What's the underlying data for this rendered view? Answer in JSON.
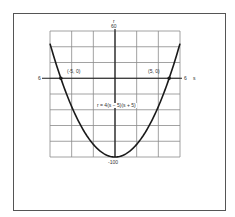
{
  "chart_data": {
    "type": "line",
    "title": "",
    "equation": "r = 4(s − 5)(s + 5)",
    "xlabel": "s",
    "ylabel": "r",
    "xlim": [
      -6,
      6
    ],
    "ylim": [
      -100,
      60
    ],
    "grid": true,
    "x_grid_step": 2,
    "y_grid_step": 20,
    "tick_labels": {
      "y_top": "60",
      "y_bottom": "-100",
      "x_left": "6",
      "x_right": "6"
    },
    "series": [
      {
        "name": "r = 4(s − 5)(s + 5)",
        "x": [
          -6,
          -5,
          -4,
          -3,
          -2,
          -1,
          0,
          1,
          2,
          3,
          4,
          5,
          6
        ],
        "y": [
          44,
          0,
          -36,
          -64,
          -84,
          -96,
          -100,
          -96,
          -84,
          -64,
          -36,
          0,
          44
        ]
      }
    ],
    "annotations": [
      {
        "text": "(-5, 0)",
        "x": -5,
        "y": 0
      },
      {
        "text": "(5, 0)",
        "x": 5,
        "y": 0
      }
    ],
    "colors": {
      "curve": "#1a1a1a",
      "grid": "#8a8a8a",
      "axis": "#1a1a1a"
    }
  },
  "labels": {
    "y_axis_name": "r",
    "y_top": "60",
    "y_bottom": "-100",
    "x_left": "6",
    "x_right": "6",
    "x_axis_name": "s",
    "point_left": "(-5,  0)",
    "point_right": "(5,  0)",
    "equation": "r = 4(s − 5)(s + 5)"
  }
}
